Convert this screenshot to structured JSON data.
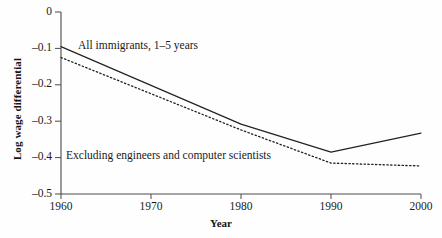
{
  "chart_data": {
    "type": "line",
    "title": "",
    "xlabel": "Year",
    "ylabel": "Log wage differential",
    "x": [
      1960,
      1970,
      1980,
      1990,
      2000
    ],
    "xlim": [
      1960,
      2000
    ],
    "ylim": [
      -0.5,
      0
    ],
    "xticks": [
      "1960",
      "1970",
      "1980",
      "1990",
      "2000"
    ],
    "yticks": [
      "0",
      "–0.1",
      "–0.2",
      "–0.3",
      "–0.4",
      "–0.5"
    ],
    "ytick_values": [
      0,
      -0.1,
      -0.2,
      -0.3,
      -0.4,
      -0.5
    ],
    "grid": false,
    "legend_position": "inline-annotations",
    "series": [
      {
        "name": "All immigrants, 1–5 years",
        "style": "solid",
        "color": "#222222",
        "x": [
          1960,
          1980,
          1990,
          2000
        ],
        "values": [
          -0.095,
          -0.308,
          -0.385,
          -0.333
        ]
      },
      {
        "name": "Excluding engineers and computer scientists",
        "style": "dotted",
        "color": "#222222",
        "x": [
          1960,
          1980,
          1990,
          2000
        ],
        "values": [
          -0.125,
          -0.324,
          -0.415,
          -0.423
        ]
      }
    ],
    "annotations": [
      {
        "text": "All immigrants, 1–5 years",
        "x": 1968,
        "y": -0.075
      },
      {
        "text": "Excluding engineers and computer scientists",
        "x": 1966,
        "y": -0.378
      }
    ]
  },
  "axes": {
    "y_tick_labels": [
      "0",
      "–0.1",
      "–0.2",
      "–0.3",
      "–0.4",
      "–0.5"
    ],
    "x_tick_labels": [
      "1960",
      "1970",
      "1980",
      "1990",
      "2000"
    ],
    "x_axis_title": "Year",
    "y_axis_title": "Log wage differential"
  }
}
